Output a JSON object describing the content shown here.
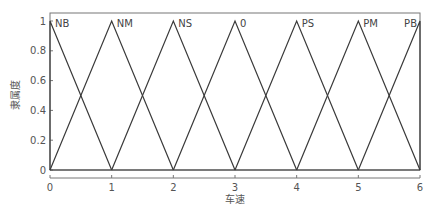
{
  "chart_data": {
    "type": "line",
    "title": "",
    "xlabel": "车速",
    "ylabel": "隶属度",
    "xlim": [
      0,
      6
    ],
    "ylim": [
      0,
      1
    ],
    "grid": false,
    "xticks": [
      "0",
      "1",
      "2",
      "3",
      "4",
      "5",
      "6"
    ],
    "yticks": [
      "0",
      "0.2",
      "0.4",
      "0.6",
      "0.8",
      "1"
    ],
    "series": [
      {
        "name": "NB",
        "x": [
          0,
          0,
          1
        ],
        "y": [
          0,
          1,
          0
        ]
      },
      {
        "name": "NM",
        "x": [
          0,
          1,
          2
        ],
        "y": [
          0,
          1,
          0
        ]
      },
      {
        "name": "NS",
        "x": [
          1,
          2,
          3
        ],
        "y": [
          0,
          1,
          0
        ]
      },
      {
        "name": "0",
        "x": [
          2,
          3,
          4
        ],
        "y": [
          0,
          1,
          0
        ]
      },
      {
        "name": "PS",
        "x": [
          3,
          4,
          5
        ],
        "y": [
          0,
          1,
          0
        ]
      },
      {
        "name": "PM",
        "x": [
          4,
          5,
          6
        ],
        "y": [
          0,
          1,
          0
        ]
      },
      {
        "name": "PB",
        "x": [
          5,
          6,
          6
        ],
        "y": [
          0,
          1,
          0
        ]
      }
    ],
    "line_color": "#3a3a3a"
  }
}
